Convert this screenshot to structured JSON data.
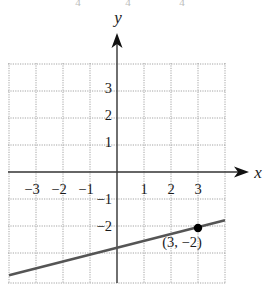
{
  "chart_data": {
    "type": "line",
    "title": "",
    "xlabel": "x",
    "ylabel": "y",
    "xlim": [
      -4,
      4
    ],
    "ylim": [
      -4,
      4
    ],
    "grid": true,
    "grid_style": "dotted",
    "x_ticks": [
      {
        "value": -3,
        "label": "−3"
      },
      {
        "value": -2,
        "label": "−2"
      },
      {
        "value": -1,
        "label": "−1"
      },
      {
        "value": 1,
        "label": "1"
      },
      {
        "value": 2,
        "label": "2"
      },
      {
        "value": 3,
        "label": "3"
      }
    ],
    "y_ticks": [
      {
        "value": 3,
        "label": "3"
      },
      {
        "value": 2,
        "label": "2"
      },
      {
        "value": 1,
        "label": "1"
      },
      {
        "value": -1,
        "label": "−1"
      },
      {
        "value": -2,
        "label": "−2"
      }
    ],
    "series": [
      {
        "name": "line",
        "slope": 0.25,
        "intercept": -2.75,
        "x": [
          -4,
          4
        ],
        "y": [
          -3.75,
          -1.75
        ],
        "color": "#555555"
      }
    ],
    "points": [
      {
        "x": 3,
        "y": -2,
        "label": "(3, −2)",
        "color": "#000000"
      }
    ]
  },
  "top_fragment": {
    "items": [
      {
        "x": 78,
        "text": "4"
      },
      {
        "x": 128,
        "text": "4"
      },
      {
        "x": 182,
        "text": "4"
      }
    ]
  },
  "colors": {
    "axis": "#333333",
    "grid": "#9a9a9a",
    "line": "#5a5a5a",
    "point": "#000000"
  }
}
